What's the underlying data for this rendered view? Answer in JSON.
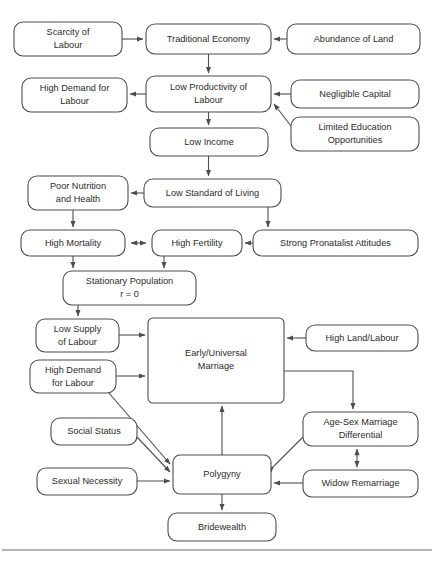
{
  "diagram": {
    "canvas": {
      "width": 434,
      "height": 562,
      "background": "#ffffff"
    },
    "style": {
      "box_stroke": "#4d4d4d",
      "box_fill": "#ffffff",
      "text_color": "#2b2b2b",
      "edge_color": "#4d4d4d",
      "rule_color": "#6b6b6b",
      "corner_radius": 9
    },
    "nodes": [
      {
        "id": "scarcity_of_labour",
        "label_line1": "Scarcity of",
        "label_line2": "Labour",
        "x": 14,
        "y": 22,
        "w": 108,
        "h": 34,
        "lines": 2
      },
      {
        "id": "traditional_economy",
        "label_line1": "Traditional Economy",
        "label_line2": "",
        "x": 146,
        "y": 24,
        "w": 125,
        "h": 30,
        "lines": 1
      },
      {
        "id": "abundance_of_land",
        "label_line1": "Abundance of Land",
        "label_line2": "",
        "x": 287,
        "y": 24,
        "w": 133,
        "h": 30,
        "lines": 1
      },
      {
        "id": "high_demand_for_labour_top",
        "label_line1": "High Demand for",
        "label_line2": "Labour",
        "x": 22,
        "y": 78,
        "w": 105,
        "h": 34,
        "lines": 2
      },
      {
        "id": "low_productivity_of_labour",
        "label_line1": "Low Productivity of",
        "label_line2": "Labour",
        "x": 146,
        "y": 76,
        "w": 125,
        "h": 36,
        "lines": 2
      },
      {
        "id": "negligible_capital",
        "label_line1": "Negligible Capital",
        "label_line2": "",
        "x": 291,
        "y": 80,
        "w": 128,
        "h": 28,
        "lines": 1
      },
      {
        "id": "limited_education_opportunities",
        "label_line1": "Limited Education",
        "label_line2": "Opportunities",
        "x": 291,
        "y": 117,
        "w": 128,
        "h": 34,
        "lines": 2
      },
      {
        "id": "low_income",
        "label_line1": "Low Income",
        "label_line2": "",
        "x": 150,
        "y": 128,
        "w": 118,
        "h": 28,
        "lines": 1
      },
      {
        "id": "poor_nutrition_and_health",
        "label_line1": "Poor Nutrition",
        "label_line2": "and Health",
        "x": 28,
        "y": 176,
        "w": 100,
        "h": 34,
        "lines": 2
      },
      {
        "id": "low_standard_of_living",
        "label_line1": "Low Standard of Living",
        "label_line2": "",
        "x": 144,
        "y": 179,
        "w": 137,
        "h": 28,
        "lines": 1
      },
      {
        "id": "high_mortality",
        "label_line1": "High Mortality",
        "label_line2": "",
        "x": 21,
        "y": 230,
        "w": 104,
        "h": 26,
        "lines": 1
      },
      {
        "id": "high_fertility",
        "label_line1": "High Fertility",
        "label_line2": "",
        "x": 152,
        "y": 230,
        "w": 90,
        "h": 26,
        "lines": 1
      },
      {
        "id": "strong_pronatalist_attitudes",
        "label_line1": "Strong Pronatalist Attitudes",
        "label_line2": "",
        "x": 253,
        "y": 230,
        "w": 165,
        "h": 26,
        "lines": 1
      },
      {
        "id": "stationary_population",
        "label_line1": "Stationary Population",
        "label_line2": "r = 0",
        "x": 63,
        "y": 271,
        "w": 133,
        "h": 34,
        "lines": 2
      },
      {
        "id": "low_supply_of_labour",
        "label_line1": "Low Supply",
        "label_line2": "of Labour",
        "x": 36,
        "y": 319,
        "w": 83,
        "h": 33,
        "lines": 2
      },
      {
        "id": "early_universal_marriage",
        "label_line1": "Early/Universal",
        "label_line2": "Marriage",
        "x": 148,
        "y": 318,
        "w": 136,
        "h": 85,
        "lines": 2
      },
      {
        "id": "high_land_labour",
        "label_line1": "High Land/Labour",
        "label_line2": "",
        "x": 306,
        "y": 325,
        "w": 112,
        "h": 26,
        "lines": 1
      },
      {
        "id": "high_demand_for_labour_bottom",
        "label_line1": "High Demand",
        "label_line2": "for Labour",
        "x": 30,
        "y": 360,
        "w": 86,
        "h": 33,
        "lines": 2
      },
      {
        "id": "age_sex_marriage_differential",
        "label_line1": "Age-Sex Marriage",
        "label_line2": "Differential",
        "x": 303,
        "y": 412,
        "w": 115,
        "h": 34,
        "lines": 2
      },
      {
        "id": "social_status",
        "label_line1": "Social Status",
        "label_line2": "",
        "x": 51,
        "y": 418,
        "w": 86,
        "h": 27,
        "lines": 1
      },
      {
        "id": "polygyny",
        "label_line1": "Polygyny",
        "label_line2": "",
        "x": 173,
        "y": 455,
        "w": 98,
        "h": 39,
        "lines": 1
      },
      {
        "id": "sexual_necessity",
        "label_line1": "Sexual Necessity",
        "label_line2": "",
        "x": 37,
        "y": 468,
        "w": 100,
        "h": 27,
        "lines": 1
      },
      {
        "id": "widow_remarriage",
        "label_line1": "Widow Remarriage",
        "label_line2": "",
        "x": 303,
        "y": 470,
        "w": 115,
        "h": 27,
        "lines": 1
      },
      {
        "id": "bridewealth",
        "label_line1": "Bridewealth",
        "label_line2": "",
        "x": 168,
        "y": 513,
        "w": 108,
        "h": 28,
        "lines": 1
      }
    ],
    "edges": [
      {
        "id": "scarcity-to-traditional",
        "from": "scarcity_of_labour",
        "to": "traditional_economy",
        "arrow": "single"
      },
      {
        "id": "abundance-to-traditional",
        "from": "abundance_of_land",
        "to": "traditional_economy",
        "arrow": "single"
      },
      {
        "id": "traditional-to-lowprod",
        "from": "traditional_economy",
        "to": "low_productivity_of_labour",
        "arrow": "single"
      },
      {
        "id": "lowprod-to-highdemand",
        "from": "low_productivity_of_labour",
        "to": "high_demand_for_labour_top",
        "arrow": "single"
      },
      {
        "id": "capital-to-lowprod",
        "from": "negligible_capital",
        "to": "low_productivity_of_labour",
        "arrow": "single"
      },
      {
        "id": "education-to-lowprod",
        "from": "limited_education_opportunities",
        "to": "low_productivity_of_labour",
        "arrow": "single"
      },
      {
        "id": "lowprod-to-lowincome",
        "from": "low_productivity_of_labour",
        "to": "low_income",
        "arrow": "single"
      },
      {
        "id": "lowincome-to-lowstandard",
        "from": "low_income",
        "to": "low_standard_of_living",
        "arrow": "single"
      },
      {
        "id": "lowstandard-to-poornutrition",
        "from": "low_standard_of_living",
        "to": "poor_nutrition_and_health",
        "arrow": "single"
      },
      {
        "id": "lowstandard-to-pronatalist",
        "from": "low_standard_of_living",
        "to": "strong_pronatalist_attitudes",
        "arrow": "single"
      },
      {
        "id": "poornutrition-to-mortality",
        "from": "poor_nutrition_and_health",
        "to": "high_mortality",
        "arrow": "single"
      },
      {
        "id": "mortality-fertility",
        "from": "high_mortality",
        "to": "high_fertility",
        "arrow": "double"
      },
      {
        "id": "pronatalist-to-fertility",
        "from": "strong_pronatalist_attitudes",
        "to": "high_fertility",
        "arrow": "single"
      },
      {
        "id": "mortality-to-stationary",
        "from": "high_mortality",
        "to": "stationary_population",
        "arrow": "single"
      },
      {
        "id": "fertility-to-stationary",
        "from": "high_fertility",
        "to": "stationary_population",
        "arrow": "single"
      },
      {
        "id": "stationary-to-lowsupply",
        "from": "stationary_population",
        "to": "low_supply_of_labour",
        "arrow": "single"
      },
      {
        "id": "lowsupply-to-marriage",
        "from": "low_supply_of_labour",
        "to": "early_universal_marriage",
        "arrow": "single"
      },
      {
        "id": "highdemand-to-marriage",
        "from": "high_demand_for_labour_bottom",
        "to": "early_universal_marriage",
        "arrow": "single"
      },
      {
        "id": "landlabour-to-marriage",
        "from": "high_land_labour",
        "to": "early_universal_marriage",
        "arrow": "single"
      },
      {
        "id": "marriage-to-agesex",
        "from": "early_universal_marriage",
        "to": "age_sex_marriage_differential",
        "arrow": "single"
      },
      {
        "id": "highdemand-to-polygyny",
        "from": "high_demand_for_labour_bottom",
        "to": "polygyny",
        "arrow": "single"
      },
      {
        "id": "socialstatus-to-polygyny",
        "from": "social_status",
        "to": "polygyny",
        "arrow": "single"
      },
      {
        "id": "sexualnecessity-to-polygyny",
        "from": "sexual_necessity",
        "to": "polygyny",
        "arrow": "single"
      },
      {
        "id": "polygyny-to-marriage",
        "from": "polygyny",
        "to": "early_universal_marriage",
        "arrow": "single"
      },
      {
        "id": "polygyny-agesex",
        "from": "polygyny",
        "to": "age_sex_marriage_differential",
        "arrow": "double"
      },
      {
        "id": "agesex-widow",
        "from": "age_sex_marriage_differential",
        "to": "widow_remarriage",
        "arrow": "double"
      },
      {
        "id": "widow-to-polygyny",
        "from": "widow_remarriage",
        "to": "polygyny",
        "arrow": "single"
      },
      {
        "id": "polygyny-to-bridewealth",
        "from": "polygyny",
        "to": "bridewealth",
        "arrow": "single"
      }
    ],
    "footer_rule": {
      "x1": 2,
      "y1": 550,
      "x2": 432,
      "y2": 550
    }
  }
}
